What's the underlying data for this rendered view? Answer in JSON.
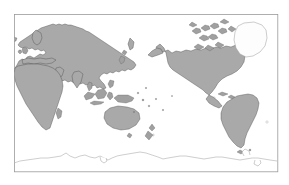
{
  "map": {
    "title": "World Map",
    "projection": "pacific-centered equirectangular",
    "frame": {
      "x": 14,
      "y": 14,
      "width": 264,
      "height": 158
    },
    "colors": {
      "background": "#ffffff",
      "ocean": "#ffffff",
      "land_fill": "#a9a9a9",
      "land_outline": "#4a4a4a",
      "hollow_fill": "#fdfdfd",
      "hollow_outline": "#9b9b9b",
      "frame_stroke": "#9a9a9a",
      "graticule": "#b9b9b9"
    },
    "features": [
      {
        "name": "eurasia",
        "label": "Eurasia",
        "style": "filled"
      },
      {
        "name": "africa",
        "label": "Africa",
        "style": "filled"
      },
      {
        "name": "north-america",
        "label": "North America",
        "style": "filled"
      },
      {
        "name": "south-america",
        "label": "South America",
        "style": "filled"
      },
      {
        "name": "australia",
        "label": "Australia",
        "style": "filled"
      },
      {
        "name": "greenland",
        "label": "Greenland",
        "style": "hollow"
      },
      {
        "name": "antarctica",
        "label": "Antarctica",
        "style": "outline"
      },
      {
        "name": "indonesia",
        "label": "Indonesian Archipelago",
        "style": "filled"
      },
      {
        "name": "new-zealand",
        "label": "New Zealand",
        "style": "filled"
      },
      {
        "name": "japan",
        "label": "Japan",
        "style": "filled"
      },
      {
        "name": "british-isles",
        "label": "British Isles",
        "style": "filled"
      },
      {
        "name": "madagascar",
        "label": "Madagascar",
        "style": "filled"
      },
      {
        "name": "iceland",
        "label": "Iceland",
        "style": "filled"
      },
      {
        "name": "arctic-archipelago",
        "label": "Canadian Arctic Archipelago",
        "style": "filled"
      },
      {
        "name": "caribbean",
        "label": "Caribbean Islands",
        "style": "filled"
      },
      {
        "name": "philippines",
        "label": "Philippines",
        "style": "filled"
      },
      {
        "name": "pacific-islands",
        "label": "Pacific Islands",
        "style": "filled"
      }
    ]
  }
}
